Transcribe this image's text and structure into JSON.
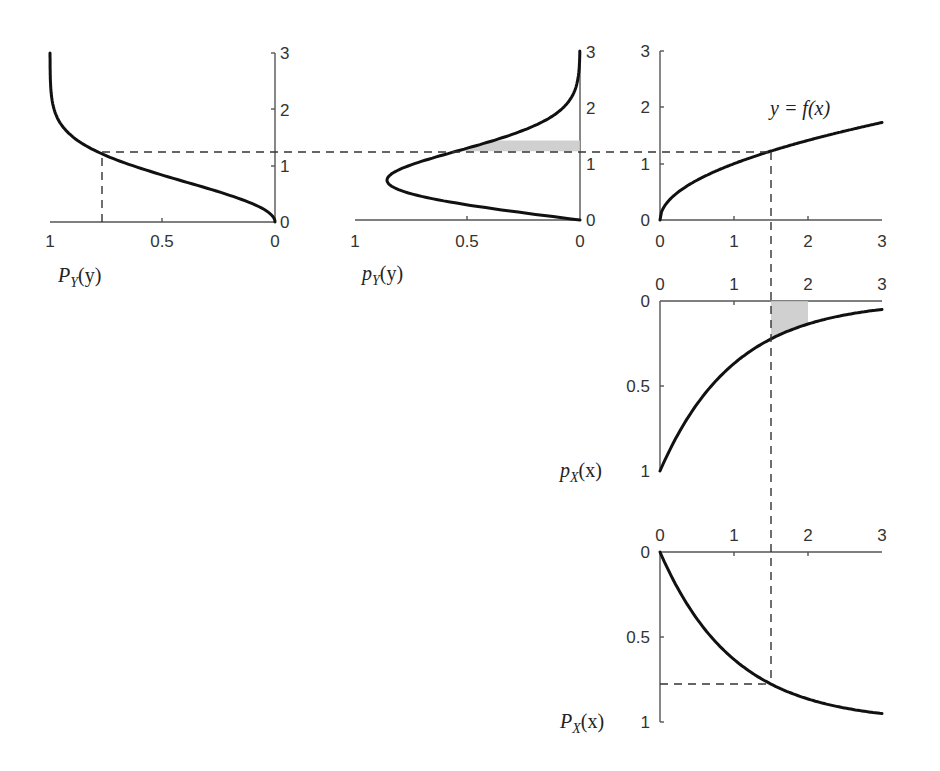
{
  "figure": {
    "colors": {
      "curve": "#111111",
      "axis": "#555555",
      "shade": "#c8c8c8",
      "dash": "#333333"
    }
  },
  "panels": {
    "PY": {
      "label_main": "P",
      "label_sub": "Y",
      "label_arg": "(y)",
      "x_ticks": [
        "1",
        "0.5",
        "0"
      ],
      "y_ticks": [
        "0",
        "1",
        "2",
        "3"
      ]
    },
    "pY": {
      "label_main": "p",
      "label_sub": "Y",
      "label_arg": "(y)",
      "x_ticks": [
        "1",
        "0.5",
        "0"
      ],
      "y_ticks": [
        "0",
        "1",
        "2",
        "3"
      ]
    },
    "f": {
      "label": "y = f(x)",
      "x_ticks": [
        "0",
        "1",
        "2",
        "3"
      ],
      "y_ticks": [
        "0",
        "1",
        "2",
        "3"
      ]
    },
    "pX": {
      "label_main": "p",
      "label_sub": "X",
      "label_arg": "(x)",
      "x_ticks": [
        "0",
        "1",
        "2",
        "3"
      ],
      "y_ticks": [
        "0",
        "0.5",
        "1"
      ]
    },
    "PX": {
      "label_main": "P",
      "label_sub": "X",
      "label_arg": "(x)",
      "x_ticks": [
        "0",
        "1",
        "2",
        "3"
      ],
      "y_ticks": [
        "0",
        "0.5",
        "1"
      ]
    }
  },
  "chart_data": [
    {
      "type": "line",
      "title": "P_Y(y)",
      "orientation": "rotated: value axis horizontal, reversed (1 at left, 0 at right); y vertical",
      "x": [
        0,
        0.25,
        0.5,
        0.75,
        1.0,
        1.22,
        1.5,
        2.0,
        2.5,
        3.0
      ],
      "values": [
        0,
        0.06,
        0.22,
        0.43,
        0.63,
        0.777,
        0.89,
        0.98,
        0.998,
        1.0
      ],
      "xlim": [
        0,
        3
      ],
      "ylim": [
        1,
        0
      ],
      "annotations": [
        "dashed marker at y=1.22, P_Y=0.777"
      ]
    },
    {
      "type": "line",
      "title": "p_Y(y)",
      "orientation": "rotated: density axis horizontal, reversed (1 at left, 0 at right); y vertical",
      "x": [
        0,
        0.25,
        0.5,
        0.707,
        1.0,
        1.22,
        1.5,
        2.0,
        2.5,
        3.0
      ],
      "values": [
        0,
        0.47,
        0.78,
        0.858,
        0.74,
        0.55,
        0.32,
        0.07,
        0.01,
        0.0
      ],
      "xlim": [
        0,
        3
      ],
      "ylim": [
        1,
        0
      ],
      "annotations": [
        "shaded band between y=1.22 and y≈1.41"
      ]
    },
    {
      "type": "line",
      "title": "y = f(x)",
      "x": [
        0,
        0.25,
        0.5,
        1.0,
        1.5,
        2.0,
        2.5,
        3.0
      ],
      "values": [
        0,
        0.5,
        0.707,
        1.0,
        1.22,
        1.41,
        1.58,
        1.73
      ],
      "xlim": [
        0,
        3
      ],
      "ylim": [
        0,
        3
      ],
      "annotations": [
        "dashed lines at x=1.5, y=1.22"
      ]
    },
    {
      "type": "line",
      "title": "p_X(x)",
      "orientation": "value axis pointing down (0 at top, 1 at bottom)",
      "x": [
        0,
        0.5,
        1.0,
        1.5,
        2.0,
        2.5,
        3.0
      ],
      "values": [
        1.0,
        0.61,
        0.37,
        0.22,
        0.14,
        0.08,
        0.05
      ],
      "xlim": [
        0,
        3
      ],
      "ylim": [
        0,
        1
      ],
      "annotations": [
        "shaded region between x=1.5 and x=2"
      ]
    },
    {
      "type": "line",
      "title": "P_X(x)",
      "orientation": "value axis pointing down (0 at top, 1 at bottom)",
      "x": [
        0,
        0.5,
        1.0,
        1.5,
        2.0,
        2.5,
        3.0
      ],
      "values": [
        0,
        0.39,
        0.63,
        0.777,
        0.86,
        0.92,
        0.95
      ],
      "xlim": [
        0,
        3
      ],
      "ylim": [
        0,
        1
      ],
      "annotations": [
        "dashed marker at x=1.5, P_X=0.777"
      ]
    }
  ]
}
